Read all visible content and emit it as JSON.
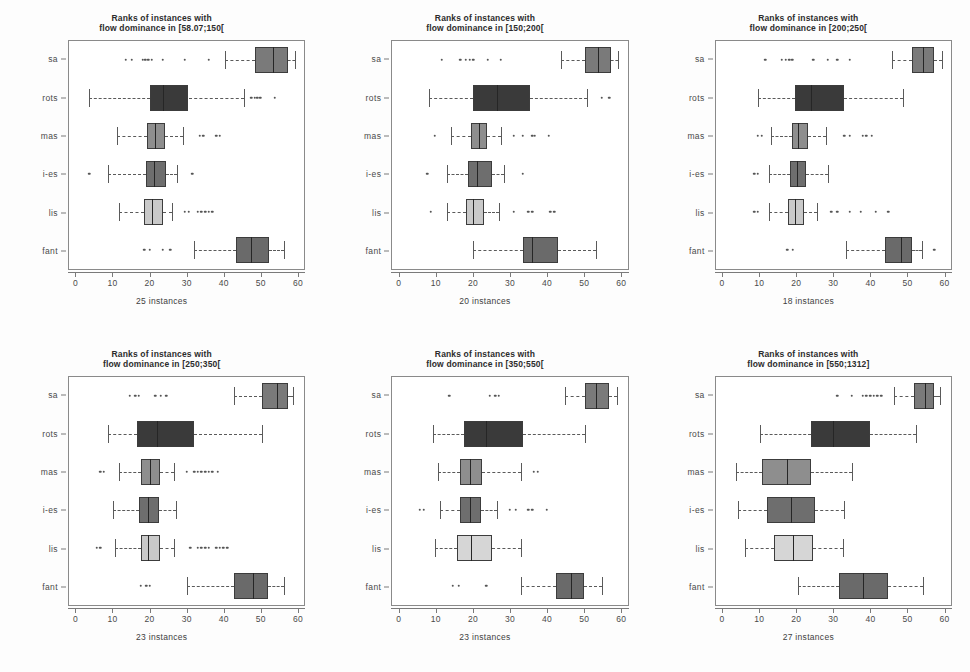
{
  "figure": {
    "width": 970,
    "height": 672,
    "background": "#fdfdfd"
  },
  "axis": {
    "x_ticks": [
      0,
      10,
      20,
      30,
      40,
      50,
      60
    ],
    "x_tick_labels": [
      "0",
      "10",
      "20",
      "30",
      "40",
      "50",
      "60"
    ],
    "x_min": -2,
    "x_max": 62,
    "y_categories": [
      "sa",
      "rots",
      "mas",
      "i-es",
      "lis",
      "fant"
    ]
  },
  "chart_data": {
    "type": "boxplot",
    "xlabel": "rank",
    "ylabel": "",
    "xlim": [
      -2,
      62
    ],
    "grid": false,
    "legend": "none",
    "categories": [
      "sa",
      "rots",
      "mas",
      "i-es",
      "lis",
      "fant"
    ],
    "panels": [
      {
        "id": "panel-1",
        "title_line1": "Ranks of instances with",
        "title_line2": "flow dominance in [58.07;150[",
        "caption": "25 instances",
        "boxes": [
          {
            "label": "sa",
            "whisker_low": 40.5,
            "q1": 48.5,
            "median": 53.5,
            "q3": 57.5,
            "whisker_high": 59.5,
            "fill": "#7a7a7a",
            "outliers": [
              13.5,
              15,
              18,
              18.8,
              19.6,
              20.5,
              23.5,
              29.5,
              36
            ]
          },
          {
            "label": "rots",
            "whisker_low": 3.5,
            "q1": 20.0,
            "median": 23.5,
            "q3": 30.5,
            "whisker_high": 45.5,
            "fill": "#3a3a3a",
            "outliers": [
              47.5,
              48.5,
              49.2,
              50,
              54
            ]
          },
          {
            "label": "mas",
            "whisker_low": 11.0,
            "q1": 19.2,
            "median": 21.5,
            "q3": 24.2,
            "whisker_high": 29.0,
            "fill": "#8e8e8e",
            "outliers": [
              33.5,
              34.5,
              38,
              39
            ]
          },
          {
            "label": "i-es",
            "whisker_low": 8.5,
            "q1": 19.0,
            "median": 21.2,
            "q3": 24.5,
            "whisker_high": 27.5,
            "fill": "#6e6e6e",
            "outliers": [
              3.5,
              31.5
            ]
          },
          {
            "label": "lis",
            "whisker_low": 11.5,
            "q1": 18.5,
            "median": 20.5,
            "q3": 23.5,
            "whisker_high": 26.0,
            "fill": "#c9c9c9",
            "outliers": [
              29.5,
              30.5,
              33,
              34,
              35,
              36,
              37
            ]
          },
          {
            "label": "fant",
            "whisker_low": 32.0,
            "q1": 43.5,
            "median": 47.5,
            "q3": 52.5,
            "whisker_high": 56.5,
            "fill": "#6a6a6a",
            "outliers": [
              18.5,
              20,
              23.5,
              25.5
            ]
          }
        ]
      },
      {
        "id": "panel-2",
        "title_line1": "Ranks of instances with",
        "title_line2": "flow dominance in [150;200[",
        "caption": "20 instances",
        "boxes": [
          {
            "label": "sa",
            "whisker_low": 44.0,
            "q1": 50.5,
            "median": 54.0,
            "q3": 57.5,
            "whisker_high": 59.5,
            "fill": "#7a7a7a",
            "outliers": [
              11.5,
              16.5,
              18,
              19,
              20,
              24,
              27.5
            ]
          },
          {
            "label": "rots",
            "whisker_low": 8.0,
            "q1": 20.0,
            "median": 26.5,
            "q3": 35.5,
            "whisker_high": 51.0,
            "fill": "#3a3a3a",
            "outliers": [
              55,
              57
            ]
          },
          {
            "label": "mas",
            "whisker_low": 14.0,
            "q1": 19.5,
            "median": 21.5,
            "q3": 23.8,
            "whisker_high": 27.5,
            "fill": "#8e8e8e",
            "outliers": [
              9.5,
              31,
              33.5,
              36,
              36.8,
              40.5
            ]
          },
          {
            "label": "i-es",
            "whisker_low": 13.0,
            "q1": 18.5,
            "median": 21.0,
            "q3": 25.0,
            "whisker_high": 28.5,
            "fill": "#6e6e6e",
            "outliers": [
              7.5,
              33.5
            ]
          },
          {
            "label": "lis",
            "whisker_low": 13.0,
            "q1": 18.0,
            "median": 20.0,
            "q3": 22.8,
            "whisker_high": 27.0,
            "fill": "#c9c9c9",
            "outliers": [
              8.5,
              31,
              35,
              36,
              41,
              42
            ]
          },
          {
            "label": "fant",
            "whisker_low": 20.0,
            "q1": 33.5,
            "median": 36.0,
            "q3": 43.0,
            "whisker_high": 53.5,
            "fill": "#6a6a6a",
            "outliers": []
          }
        ]
      },
      {
        "id": "panel-3",
        "title_line1": "Ranks of instances with",
        "title_line2": "flow dominance in [200;250[",
        "caption": "18 instances",
        "boxes": [
          {
            "label": "sa",
            "whisker_low": 46.0,
            "q1": 51.5,
            "median": 54.5,
            "q3": 57.5,
            "whisker_high": 59.5,
            "fill": "#7a7a7a",
            "outliers": [
              11.5,
              16,
              17,
              18,
              18.8,
              24.5,
              28.5,
              31,
              34.5
            ]
          },
          {
            "label": "rots",
            "whisker_low": 9.5,
            "q1": 19.5,
            "median": 24.0,
            "q3": 33.0,
            "whisker_high": 49.0,
            "fill": "#3a3a3a",
            "outliers": []
          },
          {
            "label": "mas",
            "whisker_low": 13.0,
            "q1": 18.8,
            "median": 20.5,
            "q3": 23.0,
            "whisker_high": 28.0,
            "fill": "#8e8e8e",
            "outliers": [
              9.5,
              10.5,
              33,
              34.5,
              38,
              39,
              40.5
            ]
          },
          {
            "label": "i-es",
            "whisker_low": 12.5,
            "q1": 18.2,
            "median": 20.0,
            "q3": 22.5,
            "whisker_high": 28.5,
            "fill": "#6e6e6e",
            "outliers": [
              8.5,
              9.5
            ]
          },
          {
            "label": "lis",
            "whisker_low": 12.5,
            "q1": 17.8,
            "median": 19.5,
            "q3": 22.0,
            "whisker_high": 25.5,
            "fill": "#c9c9c9",
            "outliers": [
              8.5,
              9.5,
              29.5,
              31,
              34.5,
              37.5,
              41.5,
              45
            ]
          },
          {
            "label": "fant",
            "whisker_low": 33.5,
            "q1": 44.0,
            "median": 48.5,
            "q3": 51.5,
            "whisker_high": 54.0,
            "fill": "#6a6a6a",
            "outliers": [
              17.5,
              19,
              57.5
            ]
          }
        ]
      },
      {
        "id": "panel-4",
        "title_line1": "Ranks of instances with",
        "title_line2": "flow dominance in [250;350[",
        "caption": "23 instances",
        "boxes": [
          {
            "label": "sa",
            "whisker_low": 43.0,
            "q1": 50.5,
            "median": 54.5,
            "q3": 57.5,
            "whisker_high": 59.0,
            "fill": "#7a7a7a",
            "outliers": [
              14.5,
              16,
              17,
              21.5,
              23,
              24.5
            ]
          },
          {
            "label": "rots",
            "whisker_low": 8.5,
            "q1": 16.5,
            "median": 22.0,
            "q3": 32.0,
            "whisker_high": 50.5,
            "fill": "#3a3a3a",
            "outliers": []
          },
          {
            "label": "mas",
            "whisker_low": 11.5,
            "q1": 17.5,
            "median": 20.0,
            "q3": 22.8,
            "whisker_high": 26.5,
            "fill": "#8e8e8e",
            "outliers": [
              6.5,
              7.5,
              30,
              32,
              33,
              34,
              35,
              36,
              37,
              38.5
            ]
          },
          {
            "label": "i-es",
            "whisker_low": 10.0,
            "q1": 17.0,
            "median": 19.5,
            "q3": 22.5,
            "whisker_high": 27.0,
            "fill": "#6e6e6e",
            "outliers": []
          },
          {
            "label": "lis",
            "whisker_low": 10.5,
            "q1": 17.5,
            "median": 19.5,
            "q3": 22.8,
            "whisker_high": 26.5,
            "fill": "#c9c9c9",
            "outliers": [
              5.5,
              6.5,
              31,
              33,
              34,
              35,
              36,
              38,
              39,
              40,
              41
            ]
          },
          {
            "label": "fant",
            "whisker_low": 30.0,
            "q1": 43.0,
            "median": 48.0,
            "q3": 52.0,
            "whisker_high": 56.5,
            "fill": "#6a6a6a",
            "outliers": [
              17.5,
              19,
              20
            ]
          }
        ]
      },
      {
        "id": "panel-5",
        "title_line1": "Ranks of instances with",
        "title_line2": "flow dominance in [350;550[",
        "caption": "23 instances",
        "boxes": [
          {
            "label": "sa",
            "whisker_low": 45.0,
            "q1": 50.5,
            "median": 53.5,
            "q3": 57.0,
            "whisker_high": 59.0,
            "fill": "#7a7a7a",
            "outliers": [
              13.5,
              24.5,
              26,
              27
            ]
          },
          {
            "label": "rots",
            "whisker_low": 9.0,
            "q1": 17.5,
            "median": 23.5,
            "q3": 33.5,
            "whisker_high": 50.5,
            "fill": "#3a3a3a",
            "outliers": []
          },
          {
            "label": "mas",
            "whisker_low": 10.5,
            "q1": 16.5,
            "median": 19.0,
            "q3": 22.5,
            "whisker_high": 33.0,
            "fill": "#8e8e8e",
            "outliers": [
              36.5,
              37.5
            ]
          },
          {
            "label": "i-es",
            "whisker_low": 11.0,
            "q1": 16.5,
            "median": 19.0,
            "q3": 22.0,
            "whisker_high": 26.5,
            "fill": "#6e6e6e",
            "outliers": [
              5.5,
              6.5,
              30,
              31.5,
              35,
              36,
              40
            ]
          },
          {
            "label": "lis",
            "whisker_low": 9.5,
            "q1": 15.5,
            "median": 19.5,
            "q3": 25.0,
            "whisker_high": 33.0,
            "fill": "#d6d6d6",
            "outliers": []
          },
          {
            "label": "fant",
            "whisker_low": 33.0,
            "q1": 42.5,
            "median": 46.5,
            "q3": 50.0,
            "whisker_high": 55.0,
            "fill": "#6a6a6a",
            "outliers": [
              14.5,
              16,
              23.5
            ]
          }
        ]
      },
      {
        "id": "panel-6",
        "title_line1": "Ranks of instances with",
        "title_line2": "flow dominance in [550;1312]",
        "caption": "27 instances",
        "boxes": [
          {
            "label": "sa",
            "whisker_low": 46.5,
            "q1": 52.0,
            "median": 55.0,
            "q3": 57.5,
            "whisker_high": 59.0,
            "fill": "#7a7a7a",
            "outliers": [
              31,
              35,
              38,
              39,
              40,
              41,
              42,
              43
            ]
          },
          {
            "label": "rots",
            "whisker_low": 10.0,
            "q1": 24.0,
            "median": 30.0,
            "q3": 40.0,
            "whisker_high": 52.5,
            "fill": "#3a3a3a",
            "outliers": []
          },
          {
            "label": "mas",
            "whisker_low": 3.5,
            "q1": 10.5,
            "median": 17.5,
            "q3": 24.0,
            "whisker_high": 35.0,
            "fill": "#8e8e8e",
            "outliers": []
          },
          {
            "label": "i-es",
            "whisker_low": 4.0,
            "q1": 12.0,
            "median": 18.5,
            "q3": 25.0,
            "whisker_high": 33.0,
            "fill": "#6e6e6e",
            "outliers": []
          },
          {
            "label": "lis",
            "whisker_low": 6.0,
            "q1": 14.0,
            "median": 19.0,
            "q3": 24.5,
            "whisker_high": 32.5,
            "fill": "#d6d6d6",
            "outliers": []
          },
          {
            "label": "fant",
            "whisker_low": 20.5,
            "q1": 31.5,
            "median": 38.0,
            "q3": 45.0,
            "whisker_high": 54.5,
            "fill": "#6a6a6a",
            "outliers": []
          }
        ]
      }
    ]
  }
}
